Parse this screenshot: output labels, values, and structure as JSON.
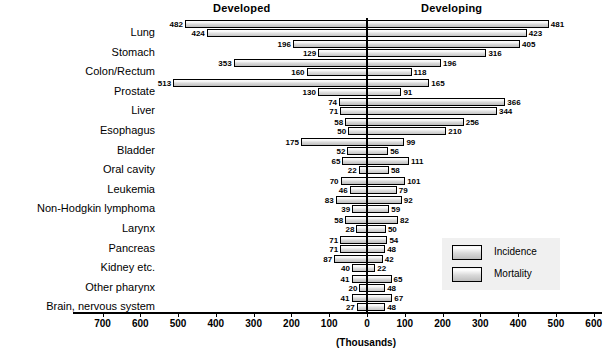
{
  "header": {
    "left_group": "Developed",
    "right_group": "Developing"
  },
  "legend": {
    "position": "middle-right",
    "items": [
      {
        "label": "Incidence"
      },
      {
        "label": "Mortality"
      }
    ]
  },
  "axis": {
    "units_label": "(Thousands)",
    "ticks": [
      700,
      600,
      500,
      400,
      300,
      200,
      100,
      0,
      100,
      200,
      300,
      400,
      500,
      600,
      700
    ],
    "max": 700,
    "step": 100
  },
  "chart_data": {
    "type": "bar",
    "orientation": "horizontal-diverging",
    "title": "",
    "subtitle": "",
    "xlabel": "(Thousands)",
    "ylabel": "",
    "xlim": [
      -700,
      700
    ],
    "grid": false,
    "legend_position": "middle-right",
    "legend": [
      "Incidence",
      "Mortality"
    ],
    "group_labels": [
      "Developed",
      "Developing"
    ],
    "categories": [
      "Lung",
      "Stomach",
      "Colon/Rectum",
      "Prostate",
      "Liver",
      "Esophagus",
      "Bladder",
      "Oral cavity",
      "Leukemia",
      "Non-Hodgkin lymphoma",
      "Larynx",
      "Pancreas",
      "Kidney etc.",
      "Other pharynx",
      "Brain, nervous system"
    ],
    "series": [
      {
        "name": "Developed Incidence",
        "side": "left",
        "measure": "Incidence",
        "values": [
          482,
          196,
          353,
          513,
          74,
          58,
          175,
          65,
          70,
          83,
          58,
          71,
          87,
          41,
          41
        ]
      },
      {
        "name": "Developed Mortality",
        "side": "left",
        "measure": "Mortality",
        "values": [
          424,
          129,
          160,
          130,
          71,
          50,
          52,
          22,
          46,
          39,
          28,
          71,
          40,
          20,
          27
        ]
      },
      {
        "name": "Developing Incidence",
        "side": "right",
        "measure": "Incidence",
        "values": [
          481,
          405,
          196,
          165,
          366,
          256,
          99,
          111,
          101,
          92,
          82,
          54,
          42,
          65,
          67
        ]
      },
      {
        "name": "Developing Mortality",
        "side": "right",
        "measure": "Mortality",
        "values": [
          423,
          316,
          118,
          91,
          344,
          210,
          56,
          58,
          79,
          59,
          50,
          48,
          22,
          48,
          48
        ]
      }
    ]
  }
}
